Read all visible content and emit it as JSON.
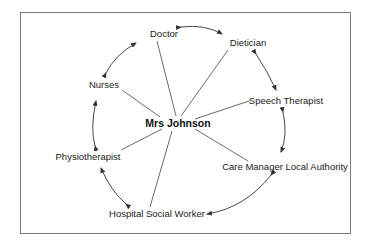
{
  "diagram": {
    "type": "hub-and-spoke with ring",
    "center": {
      "label": "Mrs Johnson"
    },
    "nodes": [
      {
        "id": "doctor",
        "label": "Doctor"
      },
      {
        "id": "dietician",
        "label": "Dietician"
      },
      {
        "id": "speech",
        "label": "Speech Therapist"
      },
      {
        "id": "caremanager",
        "label": "Care Manager Local Authority"
      },
      {
        "id": "socialworker",
        "label": "Hospital Social Worker"
      },
      {
        "id": "physio",
        "label": "Physiotherapist"
      },
      {
        "id": "nurses",
        "label": "Nurses"
      }
    ],
    "spokes": [
      "doctor",
      "dietician",
      "speech",
      "caremanager",
      "socialworker",
      "physio",
      "nurses"
    ],
    "ring_edges": [
      {
        "from": "doctor",
        "to": "dietician",
        "arrows": "both"
      },
      {
        "from": "dietician",
        "to": "speech",
        "arrows": "both"
      },
      {
        "from": "speech",
        "to": "caremanager",
        "arrows": "both"
      },
      {
        "from": "caremanager",
        "to": "socialworker",
        "arrows": "both"
      },
      {
        "from": "socialworker",
        "to": "physio",
        "arrows": "both"
      },
      {
        "from": "physio",
        "to": "nurses",
        "arrows": "both"
      },
      {
        "from": "nurses",
        "to": "doctor",
        "arrows": "both"
      }
    ],
    "colors": {
      "line": "#333333",
      "text": "#1a1a1a",
      "frame": "#7a7a7a",
      "background": "#ffffff"
    }
  }
}
